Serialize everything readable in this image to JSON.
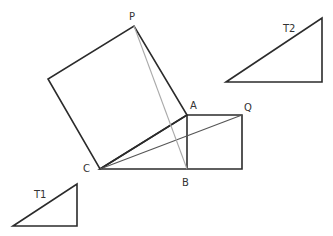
{
  "diagram": {
    "title": "",
    "colors": {
      "background": "#ffffff",
      "edge": "#2b2b2b",
      "diagonal_CQ": "#555555",
      "diagonal_PB": "#aaaaaa",
      "label": "#333333"
    },
    "points": {
      "P": {
        "label": "P",
        "x": 134,
        "y": 26
      },
      "A": {
        "label": "A",
        "x": 187,
        "y": 115
      },
      "B": {
        "label": "B",
        "x": 187,
        "y": 169
      },
      "C": {
        "label": "C",
        "x": 100,
        "y": 169
      },
      "Q": {
        "label": "Q",
        "x": 242,
        "y": 115
      }
    },
    "labels": {
      "P": "P",
      "A": "A",
      "B": "B",
      "C": "C",
      "Q": "Q",
      "T1": "T1",
      "T2": "T2"
    },
    "shapes": [
      {
        "name": "square-on-CA",
        "points": "100,169 187,115 134,26 48,79"
      },
      {
        "name": "rectangle-CB-BQ",
        "points": "100,169 242,169 242,115 187,115"
      },
      {
        "name": "triangle-T1",
        "points": "13,226 77,184 77,226"
      },
      {
        "name": "triangle-T2",
        "points": "226,82 322,18 322,82"
      }
    ],
    "segments": [
      {
        "name": "segment-AB",
        "from": "A",
        "to": "B"
      },
      {
        "name": "segment-CQ",
        "from": "C",
        "to": "Q"
      },
      {
        "name": "segment-PB",
        "from": "P",
        "to": "B"
      }
    ]
  }
}
